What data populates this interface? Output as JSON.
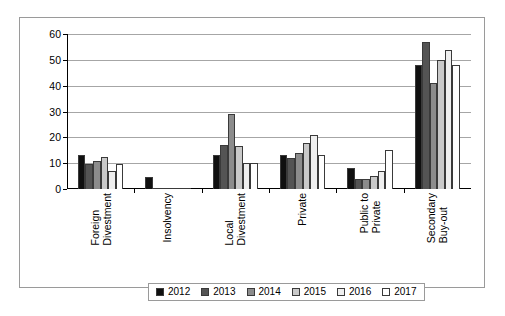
{
  "chart_data": {
    "type": "bar",
    "title": "",
    "subtitle": "",
    "xlabel": "",
    "ylabel": "",
    "ylim": [
      0,
      60
    ],
    "ytick_labels": [
      "0",
      "10",
      "20",
      "30",
      "40",
      "50",
      "60"
    ],
    "ytick_values": [
      0,
      10,
      20,
      30,
      40,
      50,
      60
    ],
    "grid": true,
    "legend_position": "bottom",
    "categories": [
      "Foreign Divestment",
      "Insolvency",
      "Local Divestment",
      "Private",
      "Public to Private",
      "Secondary Buy-out"
    ],
    "category_label_lines": [
      [
        "Foreign",
        "Divestment"
      ],
      [
        "Insolvency",
        ""
      ],
      [
        "Local",
        "Divestment"
      ],
      [
        "Private",
        ""
      ],
      [
        "Public to",
        "Private"
      ],
      [
        "Secondary",
        "Buy-out"
      ]
    ],
    "series": [
      {
        "name": "2012",
        "color": "#101010",
        "values": [
          13,
          4.5,
          13,
          13,
          8,
          48
        ]
      },
      {
        "name": "2013",
        "color": "#545454",
        "values": [
          9.5,
          0.5,
          17,
          12,
          4,
          57
        ]
      },
      {
        "name": "2014",
        "color": "#8c8c8c",
        "values": [
          11,
          0.3,
          29,
          14,
          4,
          41
        ]
      },
      {
        "name": "2015",
        "color": "#c9c9c9",
        "values": [
          12.5,
          0.3,
          16.5,
          18,
          5,
          50
        ]
      },
      {
        "name": "2016",
        "color": "#efefef",
        "values": [
          7,
          0.2,
          10,
          21,
          7,
          54
        ]
      },
      {
        "name": "2017",
        "color": "#ffffff",
        "values": [
          9.5,
          0.2,
          10,
          13,
          15,
          48
        ]
      }
    ]
  },
  "legend": {
    "items": [
      {
        "label": "2012"
      },
      {
        "label": "2013"
      },
      {
        "label": "2014"
      },
      {
        "label": "2015"
      },
      {
        "label": "2016"
      },
      {
        "label": "2017"
      }
    ]
  }
}
